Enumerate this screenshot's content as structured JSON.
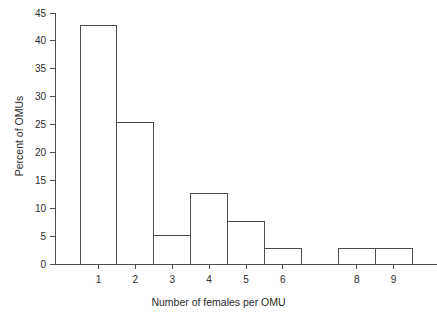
{
  "chart_data": {
    "type": "bar",
    "title": "",
    "subtitle": "",
    "xlabel": "Number of females per OMU",
    "ylabel": "Percent of OMUs",
    "categories": [
      "1",
      "2",
      "3",
      "4",
      "5",
      "6",
      "8",
      "9"
    ],
    "values": [
      42.7,
      25.3,
      5.1,
      12.6,
      7.7,
      2.7,
      2.7,
      2.7
    ],
    "xlim": [
      0.5,
      9.5
    ],
    "ylim": [
      0,
      45
    ],
    "yticks": [
      0,
      5,
      10,
      15,
      20,
      25,
      30,
      35,
      40,
      45
    ],
    "ytick_labels": [
      "0",
      "5",
      "10",
      "15",
      "20",
      "25",
      "30",
      "35",
      "40",
      "45"
    ],
    "xtick_labels": [
      "1",
      "2",
      "3",
      "4",
      "5",
      "6",
      "8",
      "9"
    ],
    "grid": false,
    "legend": null,
    "legend_position": "none",
    "bar_fill": "#ffffff",
    "bar_stroke": "#4d4d4d",
    "axis_color": "#4d4d4d",
    "text_color": "#2b2b2b",
    "background": "#ffffff",
    "annotations": []
  }
}
